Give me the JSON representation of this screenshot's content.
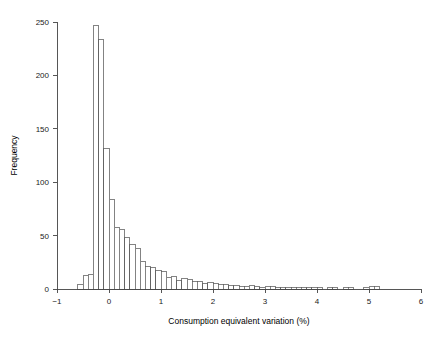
{
  "chart_data": {
    "type": "bar",
    "title": "",
    "subtitle": "",
    "xlabel": "Consumption equivalent variation (%)",
    "ylabel": "Frequency",
    "xlim": [
      -1,
      6
    ],
    "ylim": [
      0,
      250
    ],
    "bin_width": 0.1,
    "grid": false,
    "legend": null,
    "xticks": [
      -1,
      0,
      1,
      2,
      3,
      4,
      5,
      6
    ],
    "xtick_labels": [
      "−1",
      "0",
      "1",
      "2",
      "3",
      "4",
      "5",
      "6"
    ],
    "yticks": [
      0,
      50,
      100,
      150,
      200,
      250
    ],
    "ytick_labels": [
      "0",
      "50",
      "100",
      "150",
      "200",
      "250"
    ],
    "bin_starts": [
      -0.6,
      -0.5,
      -0.4,
      -0.3,
      -0.2,
      -0.1,
      0.0,
      0.1,
      0.2,
      0.3,
      0.4,
      0.5,
      0.6,
      0.7,
      0.8,
      0.9,
      1.0,
      1.1,
      1.2,
      1.3,
      1.4,
      1.5,
      1.6,
      1.7,
      1.8,
      1.9,
      2.0,
      2.1,
      2.2,
      2.3,
      2.4,
      2.5,
      2.6,
      2.7,
      2.8,
      2.9,
      3.0,
      3.1,
      3.2,
      3.3,
      3.4,
      3.5,
      3.6,
      3.7,
      3.8,
      3.9,
      4.0,
      4.1,
      4.2,
      4.3,
      4.4,
      4.5,
      4.6,
      4.7,
      4.8,
      4.9,
      5.0,
      5.1
    ],
    "categories": [
      "-0.6",
      "-0.5",
      "-0.4",
      "-0.3",
      "-0.2",
      "-0.1",
      "0.0",
      "0.1",
      "0.2",
      "0.3",
      "0.4",
      "0.5",
      "0.6",
      "0.7",
      "0.8",
      "0.9",
      "1.0",
      "1.1",
      "1.2",
      "1.3",
      "1.4",
      "1.5",
      "1.6",
      "1.7",
      "1.8",
      "1.9",
      "2.0",
      "2.1",
      "2.2",
      "2.3",
      "2.4",
      "2.5",
      "2.6",
      "2.7",
      "2.8",
      "2.9",
      "3.0",
      "3.1",
      "3.2",
      "3.3",
      "3.4",
      "3.5",
      "3.6",
      "3.7",
      "3.8",
      "3.9",
      "4.0",
      "4.1",
      "4.2",
      "4.3",
      "4.4",
      "4.5",
      "4.6",
      "4.7",
      "4.8",
      "4.9",
      "5.0",
      "5.1"
    ],
    "values": [
      4,
      13,
      14,
      247,
      234,
      132,
      84,
      58,
      56,
      48,
      42,
      38,
      26,
      21,
      20,
      17,
      16,
      11,
      12,
      8,
      10,
      9,
      7,
      7,
      5,
      6,
      5,
      4,
      4,
      3,
      3,
      2,
      2,
      3,
      2,
      1,
      2,
      2,
      1,
      1,
      1,
      1,
      1,
      1,
      1,
      1,
      1,
      0,
      1,
      1,
      0,
      1,
      1,
      0,
      0,
      1,
      2,
      2
    ]
  }
}
